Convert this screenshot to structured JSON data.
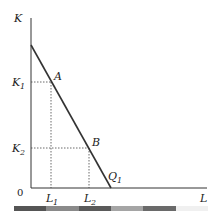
{
  "diagram": {
    "axes": {
      "y_label": "K",
      "x_label": "L",
      "origin_label": "0"
    },
    "curve": {
      "label": "Q",
      "label_sub": "1",
      "start": [
        31,
        45
      ],
      "end": [
        111,
        188
      ]
    },
    "points": [
      {
        "name": "A",
        "x": 51,
        "y": 82
      },
      {
        "name": "B",
        "x": 89,
        "y": 148
      }
    ],
    "y_ticks": [
      {
        "label": "K",
        "sub": "1",
        "y": 82
      },
      {
        "label": "K",
        "sub": "2",
        "y": 148
      }
    ],
    "x_ticks": [
      {
        "label": "L",
        "sub": "1",
        "x": 51
      },
      {
        "label": "L",
        "sub": "2",
        "x": 89
      }
    ]
  },
  "colorbar": {
    "colors": [
      "#555555",
      "#8a8a8a",
      "#5a5a5a",
      "#a5a5a5",
      "#6a6a6a",
      "#f0f0f0"
    ]
  }
}
